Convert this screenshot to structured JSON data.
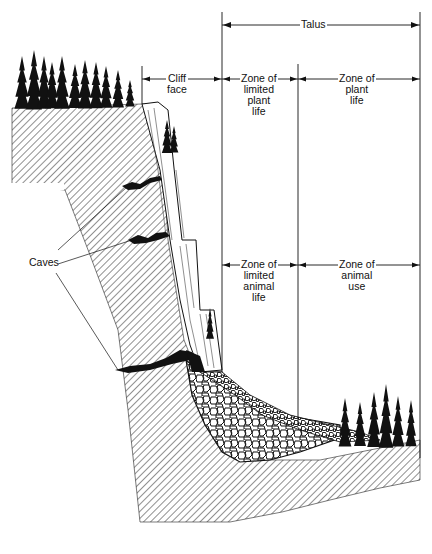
{
  "diagram": {
    "labels": {
      "talus": "Talus",
      "cliff_face": [
        "Cliff",
        "face"
      ],
      "zone_limited_plant": [
        "Zone of",
        "limited",
        "plant",
        "life"
      ],
      "zone_plant": [
        "Zone of",
        "plant",
        "life"
      ],
      "zone_limited_animal": [
        "Zone of",
        "limited",
        "animal",
        "life"
      ],
      "zone_animal_use": [
        "Zone of",
        "animal",
        "use"
      ],
      "caves": "Caves"
    },
    "caption": "",
    "colors": {
      "ink": "#111111",
      "background": "#ffffff",
      "hatch": "#333333"
    },
    "markers": {
      "cliff_left_x": 142,
      "talus_left_x": 222,
      "mid_x": 298,
      "talus_right_x": 420
    }
  }
}
